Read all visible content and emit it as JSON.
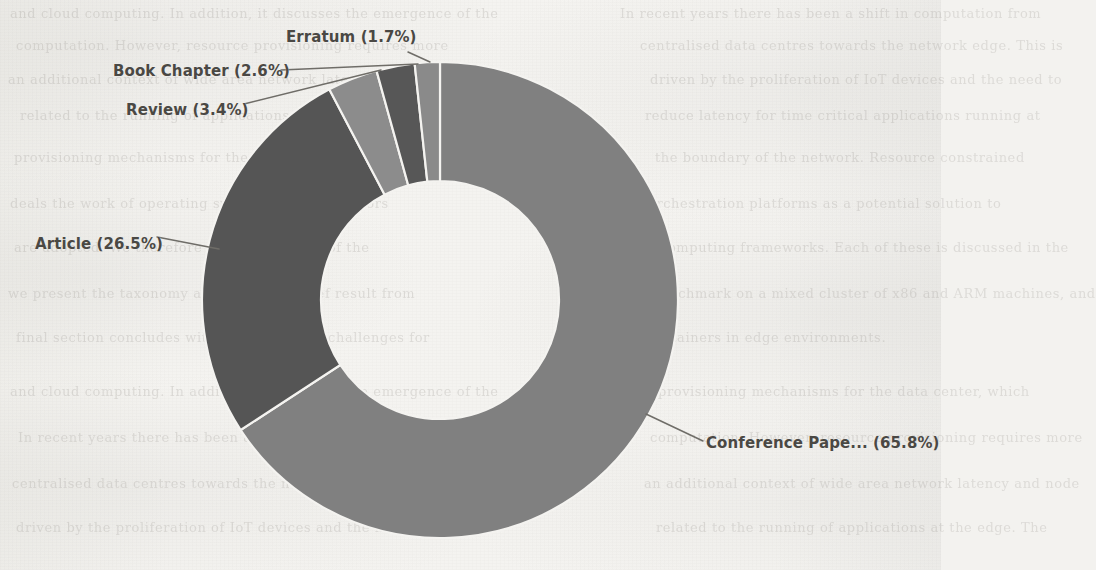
{
  "figure": {
    "background_color": "#f3f2ef",
    "label_color": "#4a4844",
    "leader_color": "#6f6d68",
    "slice_edge_color": "#f4f3f0"
  },
  "chart_data": {
    "type": "pie",
    "variant": "donut",
    "title": "",
    "xlabel": "",
    "ylabel": "",
    "legend_position": "none",
    "grid": false,
    "hole_ratio": 0.5,
    "start_angle_deg": 90,
    "direction": "clockwise",
    "center": {
      "x": 440,
      "y": 300
    },
    "outer_radius": 238,
    "inner_radius": 119,
    "units": "percent",
    "total": 100,
    "categories": [
      "Conference Paper",
      "Article",
      "Review",
      "Book Chapter",
      "Erratum"
    ],
    "values": [
      65.8,
      26.5,
      3.4,
      2.6,
      1.7
    ],
    "colors": [
      "#808080",
      "#555555",
      "#8c8c8c",
      "#575757",
      "#8a8a8a"
    ],
    "slices": [
      {
        "name": "Conference Paper",
        "display_name": "Conference Pape...",
        "value": 65.8,
        "label": "Conference Pape... (65.8%)",
        "color": "#808080",
        "truncated": true
      },
      {
        "name": "Article",
        "display_name": "Article",
        "value": 26.5,
        "label": "Article (26.5%)",
        "color": "#555555",
        "truncated": false
      },
      {
        "name": "Review",
        "display_name": "Review",
        "value": 3.4,
        "label": "Review (3.4%)",
        "color": "#8c8c8c",
        "truncated": false
      },
      {
        "name": "Book Chapter",
        "display_name": "Book Chapter",
        "value": 2.6,
        "label": "Book Chapter (2.6%)",
        "color": "#575757",
        "truncated": false
      },
      {
        "name": "Erratum",
        "display_name": "Erratum",
        "value": 1.7,
        "label": "Erratum (1.7%)",
        "color": "#8a8a8a",
        "truncated": false
      }
    ]
  },
  "background_ghost_text": [
    "and cloud computing. In addition, it discusses the emergence of the",
    "computation. However, resource provisioning requires more",
    "an additional context of wide area network latency and node",
    "related to the running of applications at the edge. The",
    "provisioning mechanisms for the data center, which",
    "deals the work of operating systems and hypervisors",
    "orchestration platforms as a potential solution to",
    "are adopted. We therefore review the state of the",
    "computing frameworks. Each of these is discussed in the",
    "we present the taxonomy and provide a brief result from",
    "benchmark on a mixed cluster of x86 and ARM machines, and",
    "final section concludes with open research challenges for",
    "containers in edge environments.",
    "In recent years there has been a shift in computation from",
    "centralised data centres towards the network edge. This is",
    "driven by the proliferation of IoT devices and the need to",
    "reduce latency for time critical applications running at",
    "the boundary of the network. Resource constrained"
  ]
}
